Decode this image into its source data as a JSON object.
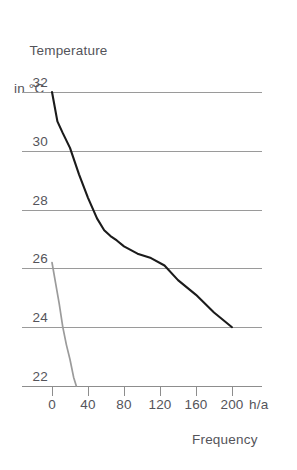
{
  "chart_data": {
    "type": "line",
    "title": "",
    "ylabel": "Temperature\nin °C",
    "ylabel_line1": "Temperature",
    "ylabel_line2": "in °C",
    "xlabel": "Frequency",
    "xunit": "h/a",
    "xlim": [
      0,
      212
    ],
    "ylim": [
      21.4,
      32.6
    ],
    "xticks": [
      0,
      40,
      80,
      120,
      160,
      200
    ],
    "xtick_labels": [
      "0",
      "40",
      "80",
      "120",
      "160",
      "200"
    ],
    "yticks": [
      22,
      24,
      26,
      28,
      30,
      32
    ],
    "ytick_labels": [
      "22",
      "24",
      "26",
      "28",
      "30",
      "32"
    ],
    "grid": true,
    "gridlines_at": [
      22,
      24,
      26,
      28,
      30,
      32
    ],
    "legend": "none",
    "series": [
      {
        "name": "primary-curve",
        "color": "#1b1b1b",
        "points": [
          [
            0,
            32.0
          ],
          [
            6,
            31.0
          ],
          [
            12,
            30.6
          ],
          [
            20,
            30.1
          ],
          [
            30,
            29.2
          ],
          [
            40,
            28.4
          ],
          [
            50,
            27.7
          ],
          [
            58,
            27.3
          ],
          [
            65,
            27.1
          ],
          [
            72,
            26.95
          ],
          [
            80,
            26.75
          ],
          [
            95,
            26.5
          ],
          [
            110,
            26.35
          ],
          [
            125,
            26.1
          ],
          [
            140,
            25.6
          ],
          [
            160,
            25.1
          ],
          [
            180,
            24.5
          ],
          [
            200,
            24.0
          ]
        ]
      },
      {
        "name": "secondary-curve",
        "color": "#9b9b9b",
        "points": [
          [
            0,
            26.2
          ],
          [
            4,
            25.5
          ],
          [
            8,
            24.8
          ],
          [
            12,
            24.0
          ],
          [
            16,
            23.4
          ],
          [
            20,
            22.9
          ],
          [
            24,
            22.3
          ],
          [
            27,
            22.0
          ]
        ]
      }
    ]
  },
  "colors": {
    "primary_series": "#1b1b1b",
    "secondary_series": "#9b9b9b",
    "gridline": "#9a9a9a",
    "axis": "#8d8d8d",
    "text": "#54545a",
    "background": "#ffffff"
  }
}
